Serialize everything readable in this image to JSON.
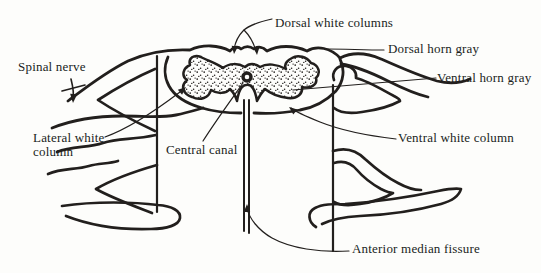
{
  "diagram": {
    "type": "anatomical-line-drawing",
    "ink_color": "#221f1d",
    "paper_color": "#fdfdfb",
    "labels": {
      "spinal_nerve": "Spinal nerve",
      "dorsal_white_columns": "Dorsal white columns",
      "dorsal_horn_gray": "Dorsal horn gray",
      "ventral_horn_gray": "Ventral horn gray",
      "lateral_white_column": "Lateral white\ncolumn",
      "central_canal": "Central canal",
      "ventral_white_column": "Ventral white column",
      "anterior_median_fissure": "Anterior median fissure"
    }
  }
}
